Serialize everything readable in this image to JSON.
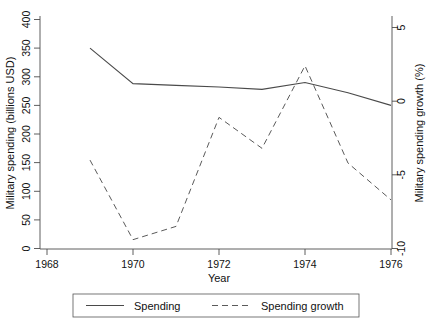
{
  "chart_data": {
    "type": "line",
    "title": "",
    "xlabel": "Year",
    "ylabel": "Military spending (billions USD)",
    "y2label": "Military spending growth (%)",
    "x": [
      1969,
      1970,
      1971,
      1972,
      1973,
      1974,
      1975,
      1976
    ],
    "xlim": [
      1968,
      1976
    ],
    "xticks": [
      1968,
      1970,
      1972,
      1974,
      1976
    ],
    "xtick_labels": [
      "1968",
      "1970",
      "1972",
      "1974",
      "1976"
    ],
    "ylim": [
      0,
      400
    ],
    "yticks": [
      0,
      50,
      100,
      150,
      200,
      250,
      300,
      350,
      400
    ],
    "ytick_labels": [
      "0",
      "50",
      "100",
      "150",
      "200",
      "250",
      "300",
      "350",
      "400"
    ],
    "y2lim": [
      -10,
      5
    ],
    "y2ticks": [
      -10,
      -5,
      0,
      5
    ],
    "y2tick_labels": [
      "-10",
      "-5",
      "0",
      "5"
    ],
    "grid": false,
    "legend_position": "bottom",
    "series": [
      {
        "name": "Spending",
        "axis": "left",
        "style": "solid",
        "color": "#4a4a4a",
        "values": [
          350,
          288,
          285,
          282,
          278,
          290,
          272,
          250
        ]
      },
      {
        "name": "Spending growth",
        "axis": "right",
        "style": "dashed",
        "color": "#5a5a5a",
        "values": [
          -4.0,
          -9.4,
          -8.5,
          -1.1,
          -3.2,
          2.4,
          -4.2,
          -6.7
        ]
      }
    ]
  },
  "legend": {
    "items": [
      {
        "label": "Spending",
        "style": "solid"
      },
      {
        "label": "Spending growth",
        "style": "dashed"
      }
    ]
  },
  "axes": {
    "x_title": "Year",
    "y_left_title": "Military spending (billions USD)",
    "y_right_title": "Military spending growth (%)"
  }
}
